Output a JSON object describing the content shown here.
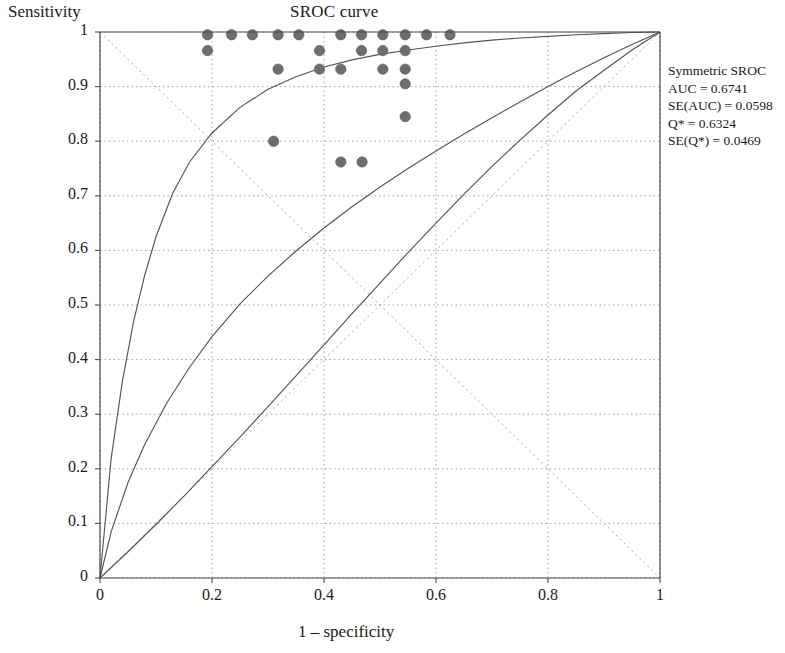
{
  "chart_data": {
    "type": "scatter",
    "title": "SROC curve",
    "xlabel": "1 – specificity",
    "ylabel": "Sensitivity",
    "xlim": [
      0,
      1
    ],
    "ylim": [
      0,
      1
    ],
    "grid": true,
    "xticks": [
      "0",
      "0.2",
      "0.4",
      "0.6",
      "0.8",
      "1"
    ],
    "xtick_values": [
      0,
      0.2,
      0.4,
      0.6,
      0.8,
      1
    ],
    "yticks": [
      "0",
      "0.1",
      "0.2",
      "0.3",
      "0.4",
      "0.5",
      "0.6",
      "0.7",
      "0.8",
      "0.9",
      "1"
    ],
    "ytick_values": [
      0,
      0.1,
      0.2,
      0.3,
      0.4,
      0.5,
      0.6,
      0.7,
      0.8,
      0.9,
      1
    ],
    "point_color": "#6e6e6e",
    "curve_color": "#555555",
    "grid_color": "#999999",
    "points": [
      {
        "x": 0.192,
        "y": 0.995
      },
      {
        "x": 0.192,
        "y": 0.966
      },
      {
        "x": 0.235,
        "y": 0.995
      },
      {
        "x": 0.272,
        "y": 0.995
      },
      {
        "x": 0.318,
        "y": 0.995
      },
      {
        "x": 0.318,
        "y": 0.932
      },
      {
        "x": 0.355,
        "y": 0.995
      },
      {
        "x": 0.392,
        "y": 0.966
      },
      {
        "x": 0.392,
        "y": 0.932
      },
      {
        "x": 0.43,
        "y": 0.995
      },
      {
        "x": 0.43,
        "y": 0.932
      },
      {
        "x": 0.467,
        "y": 0.995
      },
      {
        "x": 0.467,
        "y": 0.966
      },
      {
        "x": 0.505,
        "y": 0.995
      },
      {
        "x": 0.505,
        "y": 0.966
      },
      {
        "x": 0.505,
        "y": 0.932
      },
      {
        "x": 0.545,
        "y": 0.995
      },
      {
        "x": 0.545,
        "y": 0.966
      },
      {
        "x": 0.545,
        "y": 0.932
      },
      {
        "x": 0.545,
        "y": 0.905
      },
      {
        "x": 0.545,
        "y": 0.845
      },
      {
        "x": 0.583,
        "y": 0.995
      },
      {
        "x": 0.625,
        "y": 0.995
      },
      {
        "x": 0.31,
        "y": 0.8
      },
      {
        "x": 0.43,
        "y": 0.762
      },
      {
        "x": 0.468,
        "y": 0.762
      }
    ],
    "curves": [
      {
        "name": "sroc-upper-bound",
        "points": [
          [
            0,
            0
          ],
          [
            0.02,
            0.22
          ],
          [
            0.04,
            0.36
          ],
          [
            0.06,
            0.47
          ],
          [
            0.08,
            0.555
          ],
          [
            0.1,
            0.625
          ],
          [
            0.13,
            0.705
          ],
          [
            0.16,
            0.762
          ],
          [
            0.2,
            0.815
          ],
          [
            0.25,
            0.862
          ],
          [
            0.3,
            0.895
          ],
          [
            0.35,
            0.918
          ],
          [
            0.4,
            0.936
          ],
          [
            0.45,
            0.949
          ],
          [
            0.5,
            0.959
          ],
          [
            0.55,
            0.967
          ],
          [
            0.6,
            0.974
          ],
          [
            0.65,
            0.98
          ],
          [
            0.7,
            0.985
          ],
          [
            0.75,
            0.989
          ],
          [
            0.8,
            0.992
          ],
          [
            0.85,
            0.995
          ],
          [
            0.9,
            0.997
          ],
          [
            0.95,
            0.999
          ],
          [
            1,
            1
          ]
        ]
      },
      {
        "name": "sroc-curve",
        "points": [
          [
            0,
            0
          ],
          [
            0.02,
            0.085
          ],
          [
            0.05,
            0.175
          ],
          [
            0.08,
            0.245
          ],
          [
            0.12,
            0.322
          ],
          [
            0.16,
            0.386
          ],
          [
            0.2,
            0.442
          ],
          [
            0.25,
            0.502
          ],
          [
            0.3,
            0.553
          ],
          [
            0.35,
            0.599
          ],
          [
            0.4,
            0.641
          ],
          [
            0.45,
            0.68
          ],
          [
            0.5,
            0.716
          ],
          [
            0.55,
            0.75
          ],
          [
            0.6,
            0.782
          ],
          [
            0.65,
            0.813
          ],
          [
            0.7,
            0.843
          ],
          [
            0.75,
            0.872
          ],
          [
            0.8,
            0.9
          ],
          [
            0.85,
            0.927
          ],
          [
            0.9,
            0.953
          ],
          [
            0.95,
            0.977
          ],
          [
            1,
            1
          ]
        ]
      },
      {
        "name": "sroc-lower-bound",
        "points": [
          [
            0,
            0
          ],
          [
            0.05,
            0.048
          ],
          [
            0.1,
            0.098
          ],
          [
            0.15,
            0.15
          ],
          [
            0.2,
            0.204
          ],
          [
            0.25,
            0.258
          ],
          [
            0.3,
            0.314
          ],
          [
            0.35,
            0.37
          ],
          [
            0.4,
            0.427
          ],
          [
            0.45,
            0.484
          ],
          [
            0.5,
            0.54
          ],
          [
            0.55,
            0.596
          ],
          [
            0.6,
            0.65
          ],
          [
            0.65,
            0.703
          ],
          [
            0.7,
            0.754
          ],
          [
            0.75,
            0.802
          ],
          [
            0.8,
            0.848
          ],
          [
            0.85,
            0.892
          ],
          [
            0.9,
            0.93
          ],
          [
            0.95,
            0.967
          ],
          [
            1,
            1
          ]
        ]
      }
    ],
    "reference_lines": [
      {
        "name": "diagonal",
        "from": [
          0,
          0
        ],
        "to": [
          1,
          1
        ],
        "style": "dotted"
      },
      {
        "name": "anti-diagonal",
        "from": [
          0,
          1
        ],
        "to": [
          1,
          0
        ],
        "style": "dotted"
      }
    ]
  },
  "legend": {
    "title": "Symmetric SROC",
    "lines": [
      "AUC = 0.6741",
      "SE(AUC) = 0.0598",
      "Q* = 0.6324",
      "SE(Q*) = 0.0469"
    ],
    "auc_label": "AUC = 0.6741",
    "se_auc_label": "SE(AUC) = 0.0598",
    "qstar_label": "Q* = 0.6324",
    "se_qstar_label": "SE(Q*) = 0.0469"
  }
}
